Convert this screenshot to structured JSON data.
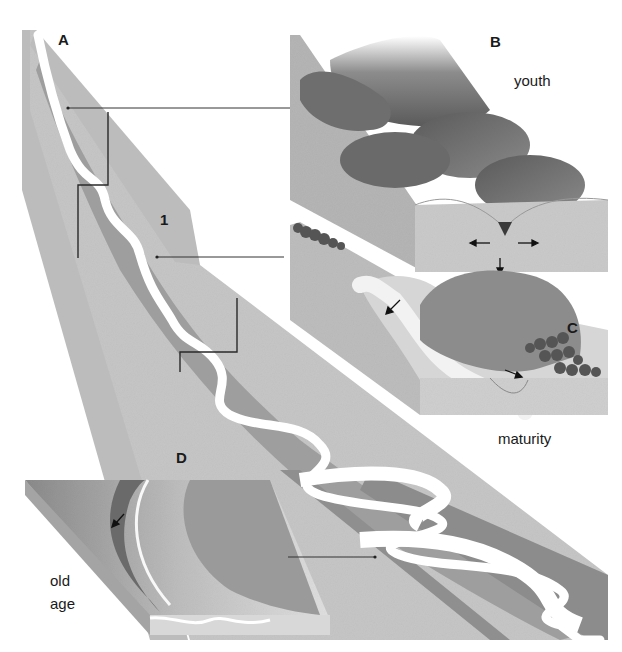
{
  "diagram": {
    "type": "river-stages-block-diagram",
    "panels": {
      "A": {
        "letter": "A",
        "description": "long river profile from source to mouth"
      },
      "B": {
        "letter": "B",
        "stage": "youth"
      },
      "C": {
        "letter": "C",
        "stage": "maturity"
      },
      "D": {
        "letter": "D",
        "stage_line1": "old",
        "stage_line2": "age"
      }
    },
    "markers": {
      "section_1": "1"
    },
    "colors": {
      "background": "#ffffff",
      "land_light": "#c4c4c4",
      "land_mid": "#a9a9a9",
      "land_dark": "#8c8c8c",
      "floodplain": "#9a9a9a",
      "river": "#ffffff",
      "lines": "#333333",
      "text": "#1a1a1a"
    }
  }
}
